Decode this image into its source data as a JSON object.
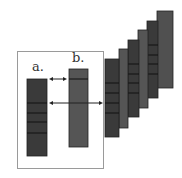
{
  "labels": {
    "a": "a.",
    "b": "b."
  },
  "colors": {
    "frame": "#9a9a9a",
    "bar_dark": "#3a3a3a",
    "bar_mid": "#555555",
    "band": "#111111",
    "arrow": "#222222"
  },
  "elements": {
    "frame_box": "rectangle enclosing bars a and b",
    "bar_a": "dark vertical bar with 4 horizontal bands",
    "bar_b": "grey vertical bar with 1 band near top",
    "arrows": [
      "double arrow between a and b (top)",
      "arrow from a through b to stack"
    ],
    "stack": "6 overlapping vertical bars receding up-right"
  }
}
